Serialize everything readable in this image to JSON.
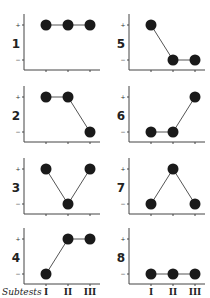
{
  "figure": {
    "x_axis_title": "Subtests",
    "x_tick_labels": [
      "I",
      "II",
      "III"
    ],
    "y_tick_labels": [
      "+",
      "−"
    ]
  },
  "chart_data": {
    "type": "line",
    "title": "",
    "xlabel": "Subtests",
    "ylabel": "",
    "categories": [
      "I",
      "II",
      "III"
    ],
    "y_levels": [
      "−",
      "+"
    ],
    "ylim": [
      0,
      1
    ],
    "grid": false,
    "legend": "none",
    "series": [
      {
        "name": "1",
        "values": [
          1,
          1,
          1
        ]
      },
      {
        "name": "2",
        "values": [
          1,
          1,
          0
        ]
      },
      {
        "name": "3",
        "values": [
          1,
          0,
          1
        ]
      },
      {
        "name": "4",
        "values": [
          0,
          1,
          1
        ]
      },
      {
        "name": "5",
        "values": [
          1,
          0,
          0
        ]
      },
      {
        "name": "6",
        "values": [
          0,
          0,
          1
        ]
      },
      {
        "name": "7",
        "values": [
          0,
          1,
          0
        ]
      },
      {
        "name": "8",
        "values": [
          0,
          0,
          0
        ]
      }
    ]
  },
  "panels": [
    {
      "label": "1",
      "values": [
        1,
        1,
        1
      ]
    },
    {
      "label": "2",
      "values": [
        1,
        1,
        0
      ]
    },
    {
      "label": "3",
      "values": [
        1,
        0,
        1
      ]
    },
    {
      "label": "4",
      "values": [
        0,
        1,
        1
      ]
    },
    {
      "label": "5",
      "values": [
        1,
        0,
        0
      ]
    },
    {
      "label": "6",
      "values": [
        0,
        0,
        1
      ]
    },
    {
      "label": "7",
      "values": [
        0,
        1,
        0
      ]
    },
    {
      "label": "8",
      "values": [
        0,
        0,
        0
      ]
    }
  ]
}
